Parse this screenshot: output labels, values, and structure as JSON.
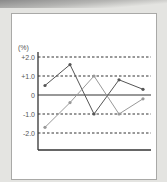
{
  "chart_data": {
    "type": "line",
    "title": "",
    "xlabel": "",
    "ylabel": "(%)",
    "ylim": [
      -27,
      23
    ],
    "yticks": [
      20,
      10,
      0,
      -10,
      -20
    ],
    "ytick_labels": [
      "+2.0",
      "+1.0",
      "0",
      "-1.0",
      "-2.0"
    ],
    "x": [
      1,
      2,
      3,
      4,
      5
    ],
    "grid": "dashed horizontal at ±10, ±20",
    "legend": "none",
    "series": [
      {
        "name": "series-dark",
        "color": "#555555",
        "values": [
          5,
          16,
          -10,
          8,
          3
        ]
      },
      {
        "name": "series-light",
        "color": "#999999",
        "values": [
          -17,
          -4,
          10,
          -10,
          -2
        ]
      }
    ]
  },
  "labels": {
    "unit": "(%)",
    "ticks": [
      "+2.0",
      "+1.0",
      "0",
      "-1.0",
      "-2.0"
    ]
  }
}
